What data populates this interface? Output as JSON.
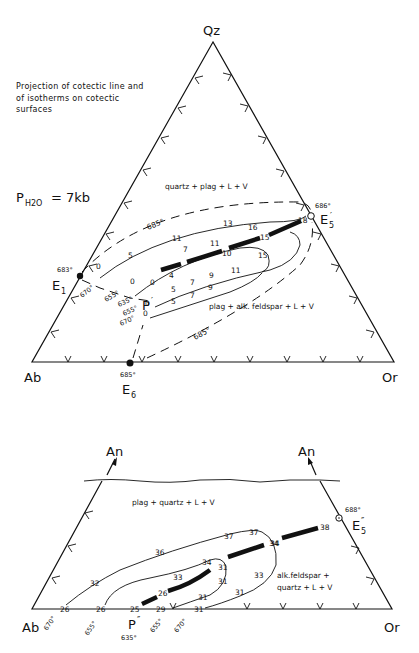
{
  "upper_diagram": {
    "title_note": [
      "Projection of cotectic line and",
      "of isotherms on cotectic",
      "surfaces"
    ],
    "pressure_label": {
      "P": "P",
      "sub": "H2O",
      "value": "= 7kb"
    },
    "vertices": {
      "top": "Qz",
      "left": "Ab",
      "right": "Or"
    },
    "points": {
      "E1": {
        "name": "E",
        "sub": "1",
        "temp": "683°"
      },
      "E6": {
        "name": "E",
        "sub": "6",
        "temp": "685°"
      },
      "E5p": {
        "name": "E",
        "sub": "5",
        "prime": "′",
        "temp": "686°"
      },
      "P": {
        "name": "P",
        "prime": "′"
      }
    },
    "fields": {
      "upper": "quartz + plag + L + V",
      "lower": "plag + alk. feldspar + L + V"
    },
    "isotherm_labels": {
      "t685_upper": "685°",
      "t685_lower": "685°",
      "t670_left": "670°",
      "t655_left": "655°",
      "t635": "635°",
      "t655_low": "655°",
      "t670_low": "670°"
    },
    "cotectic_values": [
      "0",
      "4",
      "10",
      "15",
      "18"
    ],
    "contour_values": {
      "upper_685": [
        "0",
        "5",
        "11",
        "13",
        "16"
      ],
      "upper_655": [
        "0",
        "7",
        "11"
      ],
      "lower_655": [
        "0",
        "5",
        "7",
        "9",
        "11",
        "15"
      ],
      "lower_670": [
        "0",
        "5",
        "7",
        "9"
      ]
    }
  },
  "lower_diagram": {
    "arrow_labels": [
      "An",
      "An"
    ],
    "vertices": {
      "left": "Ab",
      "right": "Or"
    },
    "points": {
      "E5pp": {
        "name": "E",
        "sub": "5",
        "prime": "″",
        "temp": "688°"
      },
      "P": {
        "name": "P",
        "prime": "″",
        "temp": "635°"
      }
    },
    "fields": {
      "upper": "plag + quartz + L + V",
      "lower_line1": "alk.feldspar +",
      "lower_line2": "quartz + L + V"
    },
    "base_labels": [
      "26",
      "26",
      "25",
      "29",
      "31"
    ],
    "base_temps": [
      "670°",
      "655°",
      "655°",
      "670°"
    ],
    "cotectic_values": [
      "26",
      "31",
      "34",
      "38"
    ],
    "contour_values": {
      "outer_670": [
        "32",
        "36",
        "37",
        "37",
        "34",
        "33",
        "31"
      ],
      "inner_655": [
        "33",
        "34",
        "31",
        "31"
      ]
    }
  }
}
